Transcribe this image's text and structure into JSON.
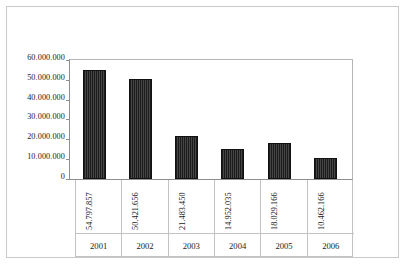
{
  "chart_data": {
    "type": "bar",
    "title": "",
    "subtitle": "",
    "xlabel": "",
    "ylabel": "",
    "categories": [
      "2001",
      "2002",
      "2003",
      "2004",
      "2005",
      "2006"
    ],
    "values": [
      54797857,
      50421656,
      21483450,
      14952035,
      18029166,
      10462166
    ],
    "value_labels": [
      "54.797.857",
      "50.421.656",
      "21.483.450",
      "14.952.035",
      "18.029.166",
      "10.462.166"
    ],
    "ylim": [
      0,
      60000000
    ],
    "ytick_values": [
      60000000,
      50000000,
      40000000,
      30000000,
      20000000,
      10000000,
      0
    ],
    "ytick_labels": [
      "60.000.000",
      "50.000.000",
      "40.000.000",
      "30.000.000",
      "20.000.000",
      "10.000.000",
      "0"
    ],
    "grid": false,
    "legend": false,
    "legend_position": "none",
    "series": [
      {
        "name": "",
        "values": [
          54797857,
          50421656,
          21483450,
          14952035,
          18029166,
          10462166
        ]
      }
    ],
    "colors": {
      "bar_fill": "#2f2f2f",
      "bar_stroke": "#111111",
      "axis": "#8e8e8e",
      "frame": "#c9c9c9",
      "table_grid": "#c2c2c2",
      "text": "#1a1a1a",
      "background": "#ffffff"
    }
  },
  "table": {
    "value_row": [
      "54.797.857",
      "50.421.656",
      "21.483.450",
      "14.952.035",
      "18.029.166",
      "10.462.166"
    ],
    "year_row": [
      "2001",
      "2002",
      "2003",
      "2004",
      "2005",
      "2006"
    ]
  }
}
